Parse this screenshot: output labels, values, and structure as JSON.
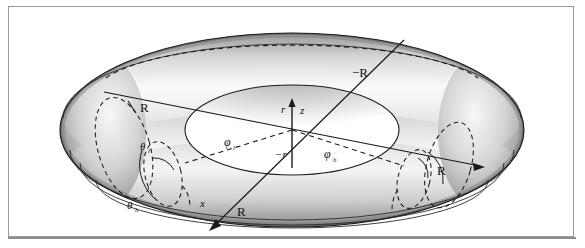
{
  "figure": {
    "background_color": "#ffffff",
    "frame_color": "#9a9a9a",
    "shading": {
      "outer_dark": "#6f6f6f",
      "mid_gray": "#b4b4b4",
      "highlight": "#fbfbfb",
      "inner_shadow": "#8a8a8a",
      "line_color": "#1a1a1a"
    }
  },
  "geometry": {
    "center": {
      "x": 292,
      "y": 130
    },
    "outer_rx": 232,
    "outer_ry": 97,
    "inner_rx": 107,
    "inner_ry": 45,
    "tube_top_ry": 64,
    "note": "viewing angle gives an elliptical projection of the torus"
  },
  "labels": [
    {
      "id": "R-left",
      "text": "R",
      "sub": "",
      "x": 140,
      "y": 110,
      "italic": false,
      "negative": false
    },
    {
      "id": "negR-top",
      "text": "−R",
      "sub": "",
      "x": 359,
      "y": 75,
      "italic": false,
      "negative": true
    },
    {
      "id": "R-right",
      "text": "R",
      "sub": "",
      "x": 440,
      "y": 172,
      "italic": false,
      "negative": false
    },
    {
      "id": "R-bottom",
      "text": "R",
      "sub": "",
      "x": 240,
      "y": 213,
      "italic": false,
      "negative": false
    },
    {
      "id": "x-axis",
      "text": "x",
      "sub": "",
      "x": 203,
      "y": 205,
      "italic": true,
      "negative": false
    },
    {
      "id": "z-axis",
      "text": "z",
      "sub": "",
      "x": 303,
      "y": 115,
      "italic": true,
      "negative": false
    },
    {
      "id": "r-pos",
      "text": "r",
      "sub": "",
      "x": 283,
      "y": 114,
      "italic": true,
      "negative": false
    },
    {
      "id": "r-neg",
      "text": "−r",
      "sub": "",
      "x": 281,
      "y": 155,
      "italic": true,
      "negative": true
    },
    {
      "id": "phi-l",
      "text": "φ",
      "sub": "l",
      "x": 228,
      "y": 145,
      "italic": true,
      "negative": false
    },
    {
      "id": "phi-h",
      "text": "φ",
      "sub": "h",
      "x": 328,
      "y": 157,
      "italic": true,
      "negative": false
    },
    {
      "id": "theta-l",
      "text": "θ",
      "sub": "l",
      "x": 146,
      "y": 148,
      "italic": true,
      "negative": false
    },
    {
      "id": "theta-h",
      "text": "θ",
      "sub": "h",
      "x": 133,
      "y": 207,
      "italic": true,
      "negative": false
    }
  ],
  "label_text": {
    "R_left": "R",
    "negR_top": "−R",
    "R_right": "R",
    "R_bottom": "R",
    "x_axis": "x",
    "z_axis": "z",
    "r_pos": "r",
    "r_neg": "−r",
    "phi": "φ",
    "theta": "θ",
    "sub_l": "l",
    "sub_h": "h"
  },
  "ghost_text": {
    "line1": "",
    "line2": ""
  }
}
